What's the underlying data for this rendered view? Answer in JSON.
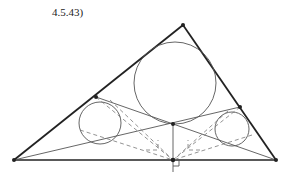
{
  "caption": "4.5.43)",
  "diagram": {
    "type": "geometry",
    "colors": {
      "stroke": "#222222",
      "thin": "#555555",
      "dashed": "#777777"
    },
    "vertices": {
      "A": [
        14,
        160
      ],
      "B": [
        276,
        160
      ],
      "C": [
        183,
        25
      ]
    },
    "points": {
      "D": [
        173,
        160
      ],
      "P": [
        173,
        124
      ],
      "E": [
        96,
        97
      ],
      "F": [
        240,
        107
      ]
    },
    "circles": [
      {
        "name": "large",
        "cx": 175,
        "cy": 83,
        "r": 41
      },
      {
        "name": "left-small",
        "cx": 100,
        "cy": 123,
        "r": 21
      },
      {
        "name": "right-small",
        "cx": 232,
        "cy": 129,
        "r": 17
      }
    ]
  }
}
